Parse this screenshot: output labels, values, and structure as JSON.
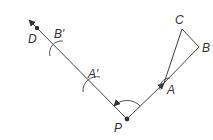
{
  "diagram": {
    "type": "geometry-construction",
    "colors": {
      "line": "#444444",
      "text": "#333333",
      "background": "#ffffff"
    },
    "labels": {
      "P": "P",
      "A": "A",
      "B": "B",
      "C": "C",
      "D": "D",
      "A_prime": "A′",
      "B_prime": "B′"
    },
    "points": {
      "P": [
        127,
        119
      ],
      "A": [
        164,
        83
      ],
      "B": [
        199,
        47
      ],
      "C": [
        182,
        29
      ],
      "D": [
        37,
        28
      ],
      "A_prime": [
        91,
        84
      ],
      "B_prime": [
        56,
        48
      ]
    }
  }
}
